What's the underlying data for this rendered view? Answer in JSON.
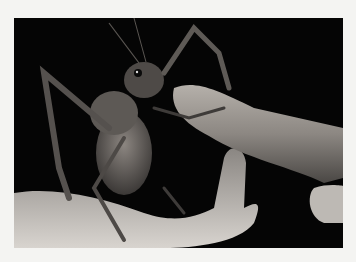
{
  "image": {
    "alt": "Black-and-white photograph of a giant weta insect perched on a human hand, eating a carrot held by fingers",
    "subject": "giant weta",
    "colors": {
      "border": "#f4f4f2",
      "background": "#050505",
      "skin": "#c9c5c0",
      "insect": "#6b6662",
      "carrot": "#9a9590"
    }
  }
}
